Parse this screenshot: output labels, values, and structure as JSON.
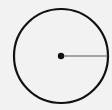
{
  "diagram": {
    "type": "circle-with-radius",
    "circle": {
      "cx": 61,
      "cy": 56,
      "r": 47,
      "stroke": "#111111",
      "stroke_width": 2.2,
      "fill": "none"
    },
    "center_point": {
      "cx": 61,
      "cy": 56,
      "r": 3.2,
      "fill": "#111111"
    },
    "radius_line": {
      "x1": 61,
      "y1": 56,
      "x2": 108,
      "y2": 56,
      "stroke": "#555555",
      "stroke_width": 1
    },
    "background": "#f2f2f2"
  }
}
